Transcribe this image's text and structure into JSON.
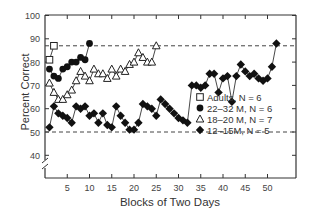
{
  "chart_data": {
    "type": "line",
    "title": "",
    "xlabel": "Blocks of Two Days",
    "ylabel": "Percent Correct",
    "xlim": [
      0,
      56
    ],
    "ylim": [
      35,
      100
    ],
    "x_ticks": [
      5,
      10,
      15,
      20,
      25,
      30,
      35,
      40,
      45,
      50
    ],
    "y_ticks": [
      40,
      50,
      60,
      70,
      80,
      90,
      100
    ],
    "grid": false,
    "axis_break": true,
    "reference_lines": [
      {
        "y": 87,
        "style": "dashed",
        "label": "criterion"
      },
      {
        "y": 50,
        "style": "dashed",
        "label": "chance"
      }
    ],
    "legend_position": "lower right",
    "series": [
      {
        "name": "Adults, N = 6",
        "marker": "open-square",
        "x": [
          1,
          2
        ],
        "values": [
          81,
          87
        ]
      },
      {
        "name": "22–32 M, N = 6",
        "marker": "filled-circle",
        "x": [
          1,
          2,
          3,
          4,
          5,
          6,
          7,
          8,
          9,
          10
        ],
        "values": [
          77,
          74,
          73,
          77,
          78,
          80,
          80,
          82,
          81,
          88
        ]
      },
      {
        "name": "18–20 M, N = 7",
        "marker": "open-triangle",
        "x": [
          1,
          2,
          3,
          4,
          5,
          6,
          7,
          8,
          9,
          10,
          11,
          12,
          13,
          14,
          15,
          16,
          17,
          18,
          19,
          20,
          21,
          22,
          23,
          24,
          25
        ],
        "values": [
          71,
          67,
          64,
          64,
          66,
          68,
          72,
          76,
          74,
          72,
          77,
          75,
          75,
          73,
          77,
          74,
          77,
          76,
          79,
          80,
          84,
          82,
          80,
          80,
          87
        ]
      },
      {
        "name": "12–15M, N = 5",
        "marker": "filled-diamond",
        "x": [
          1,
          2,
          3,
          4,
          5,
          6,
          7,
          8,
          9,
          10,
          11,
          12,
          13,
          14,
          15,
          16,
          17,
          18,
          19,
          20,
          21,
          22,
          23,
          24,
          25,
          26,
          27,
          28,
          29,
          30,
          31,
          32,
          33,
          34,
          35,
          36,
          37,
          38,
          39,
          40,
          41,
          42,
          43,
          44,
          45,
          46,
          47,
          48,
          49,
          50,
          51,
          52
        ],
        "values": [
          52,
          61,
          58,
          57,
          56,
          54,
          61,
          60,
          61,
          57,
          58,
          54,
          58,
          53,
          52,
          61,
          57,
          54,
          51,
          51,
          54,
          62,
          61,
          60,
          57,
          64,
          62,
          60,
          58,
          56,
          55,
          54,
          70,
          70,
          69,
          70,
          75,
          75,
          67,
          73,
          74,
          63,
          74,
          79,
          76,
          74,
          75,
          73,
          72,
          73,
          78,
          88
        ]
      }
    ]
  }
}
